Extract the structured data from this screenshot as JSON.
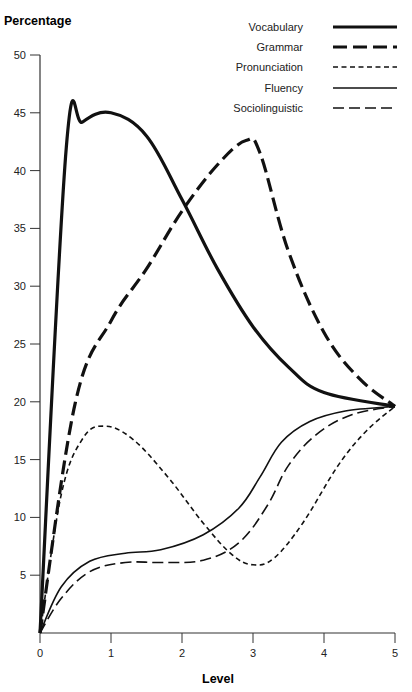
{
  "chart_data": {
    "type": "line",
    "title": "",
    "xlabel": "Level",
    "ylabel": "Percentage",
    "xlim": [
      0,
      5
    ],
    "ylim": [
      0,
      50
    ],
    "x_ticks": [
      0,
      1,
      2,
      3,
      4,
      5
    ],
    "y_ticks": [
      5,
      10,
      15,
      20,
      25,
      30,
      35,
      40,
      45,
      50
    ],
    "grid": false,
    "legend_position": "top-right",
    "series": [
      {
        "name": "Vocabulary",
        "style": "thick-solid",
        "points": [
          [
            0,
            0
          ],
          [
            0.37,
            42
          ],
          [
            0.6,
            44.2
          ],
          [
            1,
            45
          ],
          [
            1.5,
            43
          ],
          [
            2,
            37.5
          ],
          [
            2.5,
            31.5
          ],
          [
            3,
            26.5
          ],
          [
            3.5,
            23
          ],
          [
            4,
            20.8
          ],
          [
            5,
            19.6
          ]
        ]
      },
      {
        "name": "Grammar",
        "style": "thick-long-dash",
        "points": [
          [
            0,
            0
          ],
          [
            0.5,
            20
          ],
          [
            1,
            27
          ],
          [
            1.5,
            31.5
          ],
          [
            2,
            36.5
          ],
          [
            2.5,
            40.5
          ],
          [
            2.9,
            42.6
          ],
          [
            3.1,
            41.5
          ],
          [
            3.5,
            33
          ],
          [
            4,
            26
          ],
          [
            4.5,
            22
          ],
          [
            5,
            19.6
          ]
        ]
      },
      {
        "name": "Pronunciation",
        "style": "short-dash",
        "points": [
          [
            0,
            0
          ],
          [
            0.3,
            12
          ],
          [
            0.6,
            16.8
          ],
          [
            0.9,
            17.9
          ],
          [
            1.3,
            16.8
          ],
          [
            1.8,
            13.5
          ],
          [
            2.3,
            9.5
          ],
          [
            2.7,
            6.8
          ],
          [
            3,
            5.9
          ],
          [
            3.3,
            6.5
          ],
          [
            3.7,
            9.5
          ],
          [
            4.2,
            14.5
          ],
          [
            4.6,
            17.5
          ],
          [
            5,
            19.6
          ]
        ]
      },
      {
        "name": "Fluency",
        "style": "thin-solid",
        "points": [
          [
            0,
            0
          ],
          [
            0.3,
            4
          ],
          [
            0.7,
            6.2
          ],
          [
            1.2,
            6.9
          ],
          [
            1.7,
            7.2
          ],
          [
            2.3,
            8.5
          ],
          [
            2.8,
            10.8
          ],
          [
            3.1,
            13.5
          ],
          [
            3.4,
            16.5
          ],
          [
            3.8,
            18.3
          ],
          [
            4.3,
            19.2
          ],
          [
            5,
            19.6
          ]
        ]
      },
      {
        "name": "Sociolinguistic",
        "style": "thin-long-dash",
        "points": [
          [
            0,
            0
          ],
          [
            0.3,
            3
          ],
          [
            0.7,
            5.3
          ],
          [
            1.2,
            6.1
          ],
          [
            1.7,
            6.1
          ],
          [
            2.3,
            6.3
          ],
          [
            2.8,
            7.8
          ],
          [
            3.2,
            11
          ],
          [
            3.5,
            14.5
          ],
          [
            3.9,
            17.2
          ],
          [
            4.4,
            18.9
          ],
          [
            5,
            19.6
          ]
        ]
      }
    ]
  },
  "styles": {
    "line_color": "#111111",
    "axis_color": "#333333"
  }
}
